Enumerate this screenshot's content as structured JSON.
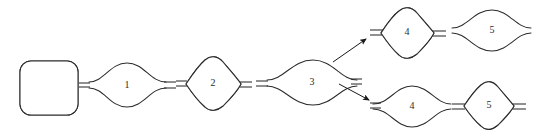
{
  "figure": {
    "background_color": "#ffffff",
    "stroke_color": "#2b2b2b",
    "hatch_color": "#4a4a4a",
    "width": 543,
    "height": 137
  },
  "nodes": [
    {
      "id": "start-block",
      "label": "",
      "shape": "rounded-square",
      "fill": "hatched",
      "hatch_direction": "backslash",
      "cx": 49,
      "cy": 88,
      "w": 58,
      "h": 54
    },
    {
      "id": "stage-1",
      "label": "1",
      "shape": "lens",
      "fill": "plain",
      "hatch_direction": "none",
      "cx": 127,
      "cy": 85,
      "w": 78,
      "h": 42
    },
    {
      "id": "stage-2",
      "label": "2",
      "shape": "diamond",
      "fill": "hatched",
      "hatch_direction": "backslash",
      "cx": 212,
      "cy": 83,
      "w": 60,
      "h": 54
    },
    {
      "id": "stage-3",
      "label": "3",
      "shape": "lens",
      "fill": "plain",
      "hatch_direction": "none",
      "cx": 313,
      "cy": 82,
      "w": 86,
      "h": 44
    },
    {
      "id": "stage-4-upper",
      "label": "4",
      "shape": "diamond",
      "fill": "hatched",
      "hatch_direction": "backslash",
      "cx": 406,
      "cy": 32,
      "w": 56,
      "h": 52
    },
    {
      "id": "stage-5-upper",
      "label": "5",
      "shape": "lens",
      "fill": "plain",
      "hatch_direction": "none",
      "cx": 492,
      "cy": 30,
      "w": 78,
      "h": 40
    },
    {
      "id": "stage-4-lower",
      "label": "4",
      "shape": "lens",
      "fill": "plain",
      "hatch_direction": "none",
      "cx": 411,
      "cy": 107,
      "w": 80,
      "h": 40
    },
    {
      "id": "stage-5-lower",
      "label": "5",
      "shape": "diamond",
      "fill": "hatched",
      "hatch_direction": "backslash",
      "cx": 492,
      "cy": 105,
      "w": 54,
      "h": 50
    }
  ],
  "arrows": [
    {
      "id": "branch-arrow-up",
      "from": "stage-3",
      "to": "stage-4-upper",
      "x1": 333,
      "y1": 62,
      "x2": 369,
      "y2": 37
    },
    {
      "id": "branch-arrow-down",
      "from": "stage-3",
      "to": "stage-4-lower",
      "x1": 339,
      "y1": 84,
      "x2": 372,
      "y2": 101
    }
  ],
  "legend": {
    "hatched_meaning": "hatched",
    "plain_meaning": "plain"
  }
}
